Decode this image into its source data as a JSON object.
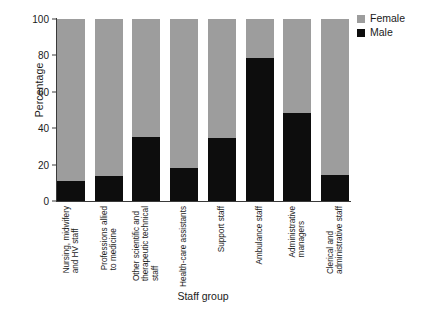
{
  "chart_data": {
    "type": "bar",
    "subtype": "stacked-percentage",
    "title": "",
    "xlabel": "Staff group",
    "ylabel": "Percentage",
    "ylim": [
      0,
      100
    ],
    "yticks": [
      0,
      20,
      40,
      60,
      80,
      100
    ],
    "grid": false,
    "legend_position": "top-right",
    "categories": [
      "Nursing, midwifery and HV staff",
      "Professions allied to medicine",
      "Other scientific and therapeutic technical staff",
      "Health-care assistants",
      "Support staff",
      "Ambulance staff",
      "Administrative managers",
      "Clerical and administrative staff"
    ],
    "category_lines": [
      [
        "Nursing, midwifery",
        "and HV staff"
      ],
      [
        "Professions allied",
        "to medicine"
      ],
      [
        "Other scientific and",
        "therapeutic technical",
        "staff"
      ],
      [
        "Health-care assistants"
      ],
      [
        "Support staff"
      ],
      [
        "Ambulance staff"
      ],
      [
        "Administrative",
        "managers"
      ],
      [
        "Clerical and",
        "administrative staff"
      ]
    ],
    "series": [
      {
        "name": "Male",
        "color": "#0d0d0d",
        "values": [
          11,
          13.5,
          35,
          18,
          34.5,
          78.5,
          48.5,
          14.5
        ]
      },
      {
        "name": "Female",
        "color": "#9d9d9d",
        "values": [
          89,
          86.5,
          65,
          82,
          65.5,
          21.5,
          51.5,
          85.5
        ]
      }
    ]
  },
  "legend": {
    "items": [
      {
        "label": "Female",
        "color": "#9d9d9d"
      },
      {
        "label": "Male",
        "color": "#0d0d0d"
      }
    ]
  }
}
